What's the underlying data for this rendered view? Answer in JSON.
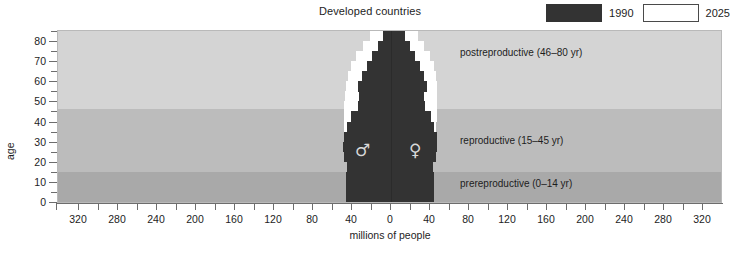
{
  "chart_data": {
    "type": "bar",
    "subtype": "population-pyramid",
    "title": "Developed countries",
    "xlabel": "millions of people",
    "ylabel": "age",
    "xlim": [
      -340,
      340
    ],
    "ylim": [
      0,
      85
    ],
    "grid": false,
    "x_tick_values": [
      -320,
      -280,
      -240,
      -200,
      -160,
      -120,
      -80,
      -40,
      0,
      40,
      80,
      120,
      160,
      200,
      240,
      280,
      320
    ],
    "x_tick_labels": [
      "320",
      "280",
      "240",
      "200",
      "160",
      "120",
      "80",
      "40",
      "0",
      "40",
      "80",
      "120",
      "160",
      "200",
      "240",
      "280",
      "320"
    ],
    "x_minor_step": 20,
    "y_tick_values": [
      0,
      10,
      20,
      30,
      40,
      50,
      60,
      70,
      80
    ],
    "y_tick_labels": [
      "0",
      "10",
      "20",
      "30",
      "40",
      "50",
      "60",
      "70",
      "80"
    ],
    "y_minor_step": 5,
    "legend_position": "top-right",
    "legend": [
      {
        "label": "1990",
        "color": "#333333",
        "swatch": "filled"
      },
      {
        "label": "2025",
        "color": "#ffffff",
        "swatch": "outline"
      }
    ],
    "sides": [
      {
        "name": "male",
        "symbol": "♂",
        "direction": "left"
      },
      {
        "name": "female",
        "symbol": "♀",
        "direction": "right"
      }
    ],
    "age_groups": [
      "0-4",
      "5-9",
      "10-14",
      "15-19",
      "20-24",
      "25-29",
      "30-34",
      "35-39",
      "40-44",
      "45-49",
      "50-54",
      "55-59",
      "60-64",
      "65-69",
      "70-74",
      "75-79",
      "80-84"
    ],
    "series": [
      {
        "name": "1990",
        "side": "male",
        "values": [
          46,
          46,
          46,
          45,
          48,
          49,
          48,
          45,
          41,
          34,
          33,
          34,
          30,
          25,
          19,
          13,
          8
        ]
      },
      {
        "name": "1990",
        "side": "female",
        "values": [
          44,
          44,
          44,
          43,
          46,
          47,
          47,
          44,
          41,
          35,
          34,
          37,
          34,
          30,
          25,
          19,
          14
        ]
      },
      {
        "name": "2025",
        "side": "male",
        "values": [
          44,
          44,
          44,
          44,
          45,
          46,
          47,
          48,
          48,
          48,
          47,
          46,
          44,
          41,
          36,
          29,
          22
        ]
      },
      {
        "name": "2025",
        "side": "female",
        "values": [
          42,
          42,
          42,
          42,
          43,
          44,
          45,
          46,
          47,
          47,
          47,
          47,
          46,
          44,
          40,
          34,
          28
        ]
      }
    ],
    "bands": [
      {
        "label": "prereproductive (0–14 yr)",
        "age_from": 0,
        "age_to": 15,
        "color": "#a9a9a9"
      },
      {
        "label": "reproductive (15–45 yr)",
        "age_from": 15,
        "age_to": 46,
        "color": "#bcbcbc"
      },
      {
        "label": "postreproductive (46–80 yr)",
        "age_from": 46,
        "age_to": 85,
        "color": "#d4d4d4"
      }
    ]
  }
}
